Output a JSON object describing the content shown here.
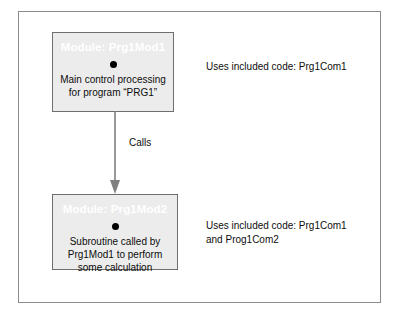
{
  "figure": {
    "modules": [
      {
        "id": "prg1mod1",
        "title": "Module: Prg1Mod1",
        "bullet_icon": "filled-circle-bullet-icon",
        "description": "Main control processing\nfor program “PRG1”"
      },
      {
        "id": "prg1mod2",
        "title": "Module: Prg1Mod2",
        "bullet_icon": "filled-circle-bullet-icon",
        "description": "Subroutine called by\nPrg1Mod1 to perform\nsome calculation"
      }
    ],
    "connector": {
      "label": "Calls",
      "icon": "down-arrow-icon",
      "from": "prg1mod1",
      "to": "prg1mod2"
    },
    "annotations": [
      {
        "id": "annotation-module-1",
        "text": "Uses included code: Prg1Com1"
      },
      {
        "id": "annotation-module-2",
        "text": "Uses included code: Prg1Com1\nand Prog1Com2"
      }
    ],
    "colors": {
      "box_fill": "#ececec",
      "box_border": "#6e6e6e",
      "frame_border": "#8b8b8b",
      "title_text": "#ffffff",
      "body_text": "#0d0d0d",
      "arrow": "#808080",
      "bullet": "#000000"
    }
  }
}
